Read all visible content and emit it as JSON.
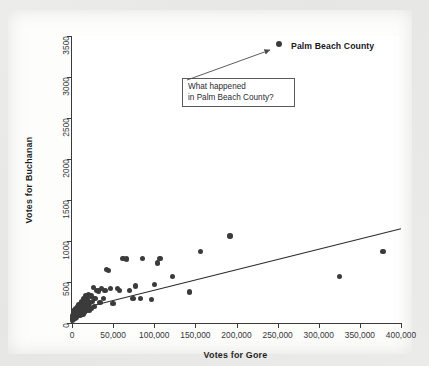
{
  "chart_data": {
    "type": "scatter",
    "title": "",
    "xlabel": "Votes for Gore",
    "ylabel": "Votes for Buchanan",
    "xlim": [
      0,
      400000
    ],
    "ylim": [
      0,
      3500
    ],
    "xticks": [
      "0",
      "50,000",
      "100,000",
      "150,000",
      "200,000",
      "250,000",
      "300,000",
      "350,000",
      "400,000"
    ],
    "xtick_values": [
      0,
      50000,
      100000,
      150000,
      200000,
      250000,
      300000,
      350000,
      400000
    ],
    "yticks": [
      "0",
      "500",
      "1000",
      "1500",
      "2000",
      "2500",
      "3000",
      "3500"
    ],
    "ytick_values": [
      0,
      500,
      1000,
      1500,
      2000,
      2500,
      3000,
      3500
    ],
    "grid": false,
    "legend": "none",
    "marker_color": "#3b3b3b",
    "line_color": "#2b2b2b",
    "trendline": {
      "x0": 0,
      "y0": 150,
      "x1": 400000,
      "y1": 1150
    },
    "annotations": [
      {
        "name": "palm-beach-callout",
        "text_line1": "What happened",
        "text_line2": "in Palm Beach County?",
        "points_to": [
          262000,
          3400
        ]
      },
      {
        "name": "palm-beach-point-label",
        "text": "Palm Beach County",
        "point": [
          252000,
          3407
        ]
      }
    ],
    "highlight_point": {
      "label": "Palm Beach County",
      "x": 252000,
      "y": 3407
    },
    "points": [
      [
        252000,
        3407
      ],
      [
        378000,
        870
      ],
      [
        325000,
        570
      ],
      [
        192000,
        1060
      ],
      [
        156000,
        870
      ],
      [
        143000,
        380
      ],
      [
        122000,
        570
      ],
      [
        107000,
        790
      ],
      [
        104000,
        730
      ],
      [
        100000,
        470
      ],
      [
        97000,
        290
      ],
      [
        86000,
        790
      ],
      [
        83000,
        300
      ],
      [
        77000,
        450
      ],
      [
        74000,
        300
      ],
      [
        70000,
        400
      ],
      [
        66000,
        780
      ],
      [
        62000,
        790
      ],
      [
        58000,
        400
      ],
      [
        55000,
        420
      ],
      [
        50000,
        240
      ],
      [
        47000,
        420
      ],
      [
        44000,
        640
      ],
      [
        42000,
        650
      ],
      [
        40000,
        400
      ],
      [
        38000,
        300
      ],
      [
        36000,
        420
      ],
      [
        34000,
        250
      ],
      [
        32000,
        390
      ],
      [
        30000,
        400
      ],
      [
        28000,
        300
      ],
      [
        27000,
        200
      ],
      [
        26000,
        430
      ],
      [
        25000,
        260
      ],
      [
        24000,
        180
      ],
      [
        23000,
        330
      ],
      [
        22000,
        250
      ],
      [
        21000,
        150
      ],
      [
        20000,
        350
      ],
      [
        19500,
        220
      ],
      [
        19000,
        290
      ],
      [
        18000,
        160
      ],
      [
        17500,
        260
      ],
      [
        17000,
        330
      ],
      [
        16000,
        200
      ],
      [
        15500,
        130
      ],
      [
        15000,
        250
      ],
      [
        14500,
        180
      ],
      [
        14000,
        300
      ],
      [
        13500,
        110
      ],
      [
        13000,
        210
      ],
      [
        12500,
        160
      ],
      [
        12000,
        260
      ],
      [
        11500,
        120
      ],
      [
        11000,
        190
      ],
      [
        10500,
        240
      ],
      [
        10000,
        140
      ],
      [
        9500,
        100
      ],
      [
        9000,
        180
      ],
      [
        8500,
        220
      ],
      [
        8000,
        130
      ],
      [
        7500,
        90
      ],
      [
        7000,
        160
      ],
      [
        6500,
        200
      ],
      [
        6000,
        110
      ],
      [
        5500,
        70
      ],
      [
        5000,
        140
      ],
      [
        4500,
        180
      ],
      [
        4000,
        100
      ],
      [
        3500,
        60
      ],
      [
        3000,
        120
      ],
      [
        2500,
        150
      ],
      [
        2000,
        80
      ],
      [
        1500,
        50
      ],
      [
        1000,
        90
      ],
      [
        800,
        40
      ],
      [
        500,
        60
      ],
      [
        300,
        30
      ]
    ]
  }
}
